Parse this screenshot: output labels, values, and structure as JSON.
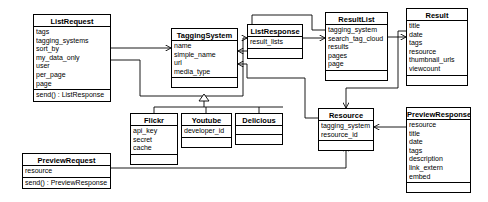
{
  "diagram": {
    "type": "uml-class-diagram",
    "background_color": "#ffffff",
    "line_color": "#000000",
    "text_color": "#000000"
  },
  "classes": [
    {
      "id": "list-request",
      "name": "ListRequest",
      "attributes": [
        "tags",
        "tagging_systems",
        "sort_by",
        "my_data_only",
        "user",
        "per_page",
        "page"
      ],
      "methods": [
        "send() : ListResponse"
      ],
      "x": 33,
      "y": 14,
      "width": 78
    },
    {
      "id": "tagging-system",
      "name": "TaggingSystem",
      "attributes": [
        "name",
        "simple_name",
        "url",
        "media_type"
      ],
      "methods": [],
      "x": 171,
      "y": 28,
      "width": 67
    },
    {
      "id": "list-response",
      "name": "ListResponse",
      "attributes": [
        "result_lists"
      ],
      "methods": [],
      "x": 247,
      "y": 24,
      "width": 56
    },
    {
      "id": "result-list",
      "name": "ResultList",
      "attributes": [
        "tagging_system",
        "search_tag_cloud",
        "results",
        "pages",
        "page"
      ],
      "methods": [],
      "x": 325,
      "y": 12,
      "width": 63
    },
    {
      "id": "result",
      "name": "Result",
      "attributes": [
        "title",
        "date",
        "tags",
        "resource",
        "thumbnail_urls",
        "viewcount"
      ],
      "methods": [],
      "x": 406,
      "y": 8,
      "width": 62
    },
    {
      "id": "flickr",
      "name": "Flickr",
      "attributes": [
        "api_key",
        "secret",
        "cache"
      ],
      "methods": [],
      "x": 130,
      "y": 113,
      "width": 48
    },
    {
      "id": "youtube",
      "name": "Youtube",
      "attributes": [
        "developer_id"
      ],
      "methods": [],
      "x": 181,
      "y": 113,
      "width": 51
    },
    {
      "id": "delicious",
      "name": "Delicious",
      "attributes": [],
      "methods": [],
      "x": 235,
      "y": 113,
      "width": 48
    },
    {
      "id": "resource",
      "name": "Resource",
      "attributes": [
        "tagging_system",
        "resource_id"
      ],
      "methods": [],
      "x": 318,
      "y": 108,
      "width": 56
    },
    {
      "id": "preview-response",
      "name": "PreviewResponse",
      "attributes": [
        "resource",
        "title",
        "date",
        "tags",
        "description",
        "link_extern",
        "embed"
      ],
      "methods": [],
      "x": 406,
      "y": 107,
      "width": 65
    },
    {
      "id": "preview-request",
      "name": "PreviewRequest",
      "attributes": [
        "resource"
      ],
      "methods": [
        "send() : PreviewResponse"
      ],
      "x": 22,
      "y": 153,
      "width": 89
    }
  ],
  "relationships": [
    {
      "id": "listrequest-to-taggingsystem",
      "from": "ListRequest",
      "to": "TaggingSystem",
      "kind": "association-arrow"
    },
    {
      "id": "listrequest-to-listresponse",
      "from": "ListRequest",
      "to": "ListResponse",
      "kind": "association-arrow"
    },
    {
      "id": "listresponse-to-resultlist",
      "from": "ListResponse",
      "to": "ResultList",
      "kind": "association-arrow"
    },
    {
      "id": "resultlist-to-taggingsystem",
      "from": "ResultList",
      "to": "TaggingSystem",
      "kind": "association-arrow"
    },
    {
      "id": "resultlist-to-result",
      "from": "ResultList",
      "to": "Result",
      "kind": "association-arrow"
    },
    {
      "id": "result-to-resource",
      "from": "Result",
      "to": "Resource",
      "kind": "association-arrow"
    },
    {
      "id": "resource-to-taggingsystem",
      "from": "Resource",
      "to": "TaggingSystem",
      "kind": "association-arrow"
    },
    {
      "id": "previewresponse-to-resource",
      "from": "PreviewResponse",
      "to": "Resource",
      "kind": "association-arrow"
    },
    {
      "id": "previewrequest-to-resource",
      "from": "PreviewRequest",
      "to": "Resource",
      "kind": "association-arrow"
    },
    {
      "id": "flickr-generalization",
      "from": "Flickr",
      "to": "TaggingSystem",
      "kind": "generalization"
    },
    {
      "id": "youtube-generalization",
      "from": "Youtube",
      "to": "TaggingSystem",
      "kind": "generalization"
    },
    {
      "id": "delicious-generalization",
      "from": "Delicious",
      "to": "TaggingSystem",
      "kind": "generalization"
    }
  ]
}
